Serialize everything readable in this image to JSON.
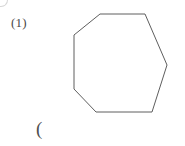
{
  "figure": {
    "label": "(1)",
    "trailing_text": "(",
    "background_color": "#ffffff",
    "stroke_color": "#5e5e5e",
    "label_color": "#4a4a4a",
    "width": 185,
    "height": 146
  },
  "shape": {
    "name": "heptagon",
    "sides": 7,
    "fill": "none",
    "stroke_color": "#5e5e5e",
    "stroke_width": 1,
    "vertices": [
      [
        100,
        14
      ],
      [
        145,
        14
      ],
      [
        167,
        65
      ],
      [
        152,
        112
      ],
      [
        96,
        112
      ],
      [
        74,
        89
      ],
      [
        74,
        35
      ]
    ],
    "points_string": "100,14 145,14 167,65 152,112 96,112 74,89 74,35"
  }
}
